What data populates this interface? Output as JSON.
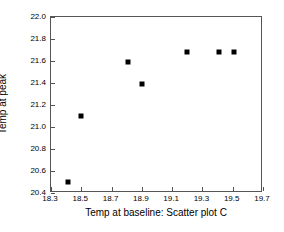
{
  "chart_data": {
    "type": "scatter",
    "title": "",
    "xlabel": "Temp at baseline: Scatter plot C",
    "ylabel": "Temp at peak",
    "xlim": [
      18.3,
      19.7
    ],
    "ylim": [
      20.4,
      22.0
    ],
    "xticks": [
      "18.3",
      "18.5",
      "18.7",
      "18.9",
      "19.1",
      "19.3",
      "19.5",
      "19.7"
    ],
    "xtick_values": [
      18.3,
      18.5,
      18.7,
      18.9,
      19.1,
      19.3,
      19.5,
      19.7
    ],
    "yticks": [
      "20.4",
      "20.6",
      "20.8",
      "21.0",
      "21.2",
      "21.4",
      "21.6",
      "21.8",
      "22.0"
    ],
    "ytick_values": [
      20.4,
      20.6,
      20.8,
      21.0,
      21.2,
      21.4,
      21.6,
      21.8,
      22.0
    ],
    "grid": false,
    "legend": false,
    "marker": "filled-square",
    "marker_color": "#000000",
    "x": [
      18.41,
      18.5,
      18.81,
      18.9,
      19.2,
      19.41,
      19.51
    ],
    "y": [
      20.5,
      21.1,
      21.59,
      21.39,
      21.68,
      21.68,
      21.68
    ],
    "points": [
      {
        "x": 18.41,
        "y": 20.5
      },
      {
        "x": 18.5,
        "y": 21.1
      },
      {
        "x": 18.81,
        "y": 21.59
      },
      {
        "x": 18.9,
        "y": 21.39
      },
      {
        "x": 19.2,
        "y": 21.68
      },
      {
        "x": 19.41,
        "y": 21.68
      },
      {
        "x": 19.51,
        "y": 21.68
      }
    ]
  }
}
